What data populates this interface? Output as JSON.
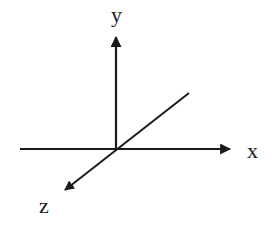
{
  "diagram": {
    "colors": {
      "stroke": "#1a1a1a",
      "background": "#ffffff"
    },
    "origin": [
      116,
      149
    ],
    "axes": [
      {
        "name": "x",
        "label": "x",
        "from": [
          20,
          149
        ],
        "to": [
          232,
          149
        ]
      },
      {
        "name": "y",
        "label": "y",
        "from": [
          116,
          149
        ],
        "to": [
          116,
          35
        ]
      },
      {
        "name": "z",
        "label": "z",
        "from": [
          189,
          93
        ],
        "to": [
          63,
          192
        ]
      }
    ]
  }
}
